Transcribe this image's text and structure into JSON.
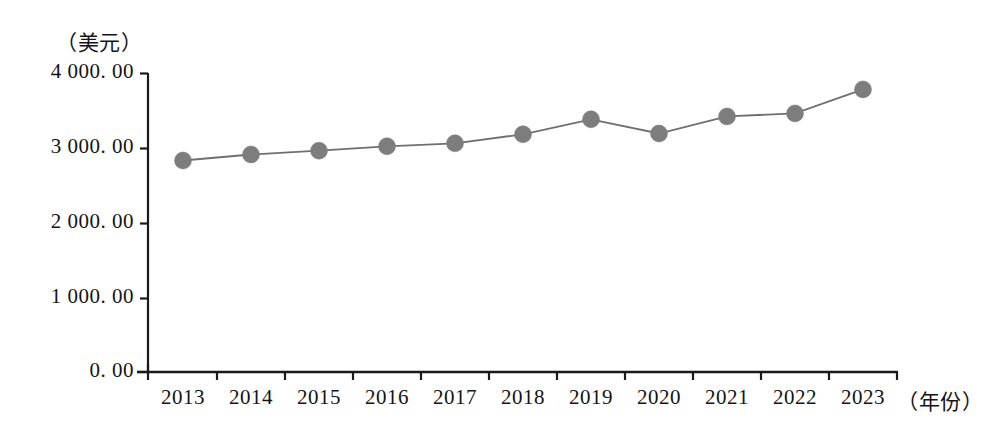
{
  "chart_data": {
    "type": "line",
    "title": "",
    "subtitle": "",
    "xlabel": "（年份）",
    "ylabel": "（美元）",
    "categories": [
      "2013",
      "2014",
      "2015",
      "2016",
      "2017",
      "2018",
      "2019",
      "2020",
      "2021",
      "2022",
      "2023"
    ],
    "values": [
      2830,
      2910,
      2960,
      3020,
      3060,
      3180,
      3380,
      3190,
      3420,
      3460,
      3780
    ],
    "series": [
      {
        "name": "",
        "values": [
          2830,
          2910,
          2960,
          3020,
          3060,
          3180,
          3380,
          3190,
          3420,
          3460,
          3780
        ]
      }
    ],
    "ylim": [
      0,
      4000
    ],
    "y_ticks": [
      0,
      1000,
      2000,
      3000,
      4000
    ],
    "y_tick_labels": [
      "0. 00",
      "1 000. 00",
      "2 000. 00",
      "3 000. 00",
      "4 000. 00"
    ],
    "x_tick_labels": [
      "2013",
      "2014",
      "2015",
      "2016",
      "2017",
      "2018",
      "2019",
      "2020",
      "2021",
      "2022",
      "2023"
    ],
    "grid": false,
    "legend": null,
    "legend_position": "none",
    "marker": "circle",
    "marker_color": "#7d7d7d",
    "line_color": "#6f6f6f",
    "axis_color": "#1a1a1a"
  },
  "axes": {
    "y_unit": "（美元）",
    "x_unit": "（年份）"
  }
}
